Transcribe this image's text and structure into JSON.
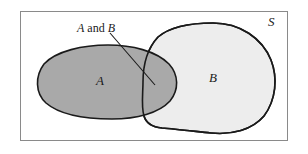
{
  "figure": {
    "type": "venn-diagram",
    "frame": {
      "stroke_color": "#8a8a8a",
      "fill_color": "#ffffff"
    }
  },
  "labels": {
    "universe": "S",
    "set_a": "A",
    "set_b": "B",
    "intersection_symbol_a": "A",
    "intersection_conjunction": "and",
    "intersection_symbol_b": "B"
  },
  "regions": [
    {
      "name": "set-a",
      "label": "A",
      "fill": "#a9a9a9",
      "stroke": "#1a1a1a"
    },
    {
      "name": "set-b",
      "label": "B",
      "fill": "#ededed",
      "stroke": "#1a1a1a"
    },
    {
      "name": "intersection",
      "label": "A and B",
      "fill": "#a9a9a9",
      "stroke": "#1a1a1a"
    }
  ],
  "annotation": {
    "text": "A and B",
    "leader_line": {
      "from_x": 110,
      "from_y": 33,
      "to_x": 155,
      "to_y": 85,
      "stroke": "#1a1a1a"
    }
  },
  "colors": {
    "set_a_fill": "#a9a9a9",
    "set_b_fill": "#ededed",
    "outline": "#1a1a1a",
    "frame": "#8a8a8a",
    "background": "#ffffff",
    "text": "#1a1a1a"
  }
}
